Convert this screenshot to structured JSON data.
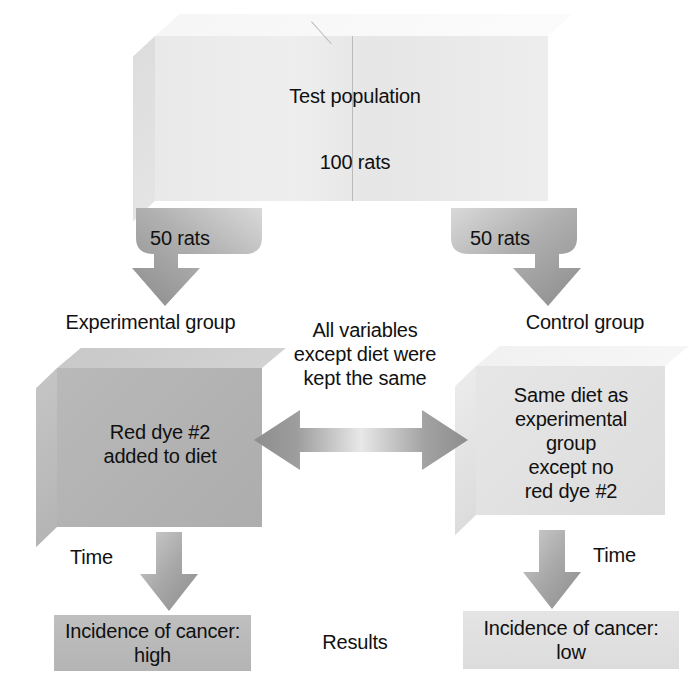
{
  "diagram": {
    "title_text": "Test population",
    "top_box": {
      "line1": "Test population",
      "line2": "100 rats"
    },
    "split_arrows": {
      "left_label": "50 rats",
      "right_label": "50 rats"
    },
    "group_labels": {
      "experimental": "Experimental group",
      "control": "Control group"
    },
    "experimental_box": {
      "text": "Red dye #2\nadded to diet"
    },
    "control_box": {
      "text": "Same diet as\nexperimental\ngroup\nexcept no\nred dye #2"
    },
    "center_note": "All variables\nexcept diet were\nkept the same",
    "time_labels": {
      "left": "Time",
      "right": "Time"
    },
    "results_label": "Results",
    "results": {
      "left": "Incidence of cancer:\nhigh",
      "right": "Incidence of cancer:\nlow"
    },
    "colors": {
      "top_box_face": "#ededed",
      "experimental_face": "#b3b3b3",
      "control_face": "#e2e2e2",
      "result_left": "#bbbbbb",
      "result_right": "#e0e0e0",
      "arrow_dark": "#8f8f8f",
      "arrow_light": "#d8d8d8",
      "text": "#111111"
    }
  }
}
